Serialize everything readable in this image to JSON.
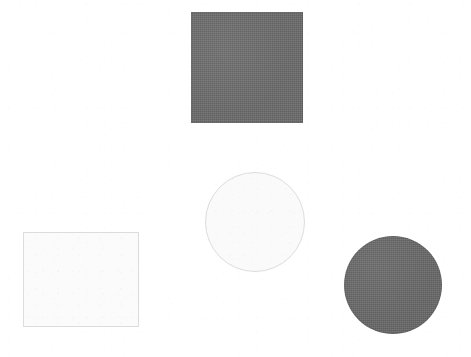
{
  "canvas": {
    "width": 471,
    "height": 357,
    "background_color": "#ffffff",
    "description": "Four plain geometric shapes on a white scanned page"
  },
  "palette": {
    "page_background": "#ffffff",
    "dark_fill": "#6b6b6b",
    "light_fill": "#fbfbfb",
    "light_outline": "#dcdcdc"
  },
  "shapes": [
    {
      "id": "dark-square",
      "shape": "square",
      "fill_style": "filled",
      "fill_color": "#6b6b6b",
      "outline_color": "#6b6b6b",
      "x": 191,
      "y": 12,
      "width": 112,
      "height": 111,
      "center_x": 247,
      "center_y": 67,
      "position": "top-center"
    },
    {
      "id": "light-square",
      "shape": "square",
      "fill_style": "outline",
      "fill_color": "#fbfbfb",
      "outline_color": "#dcdcdc",
      "x": 23,
      "y": 232,
      "width": 116,
      "height": 95,
      "center_x": 81,
      "center_y": 280,
      "position": "bottom-left"
    },
    {
      "id": "light-circle",
      "shape": "circle",
      "fill_style": "outline",
      "fill_color": "#fafafa",
      "outline_color": "#dddddd",
      "x": 205,
      "y": 172,
      "width": 100,
      "height": 100,
      "center_x": 255,
      "center_y": 222,
      "diameter": 100,
      "position": "center"
    },
    {
      "id": "dark-circle",
      "shape": "circle",
      "fill_style": "filled",
      "fill_color": "#686868",
      "outline_color": "#686868",
      "x": 344,
      "y": 236,
      "width": 98,
      "height": 98,
      "center_x": 393,
      "center_y": 285,
      "diameter": 98,
      "position": "bottom-right"
    }
  ]
}
